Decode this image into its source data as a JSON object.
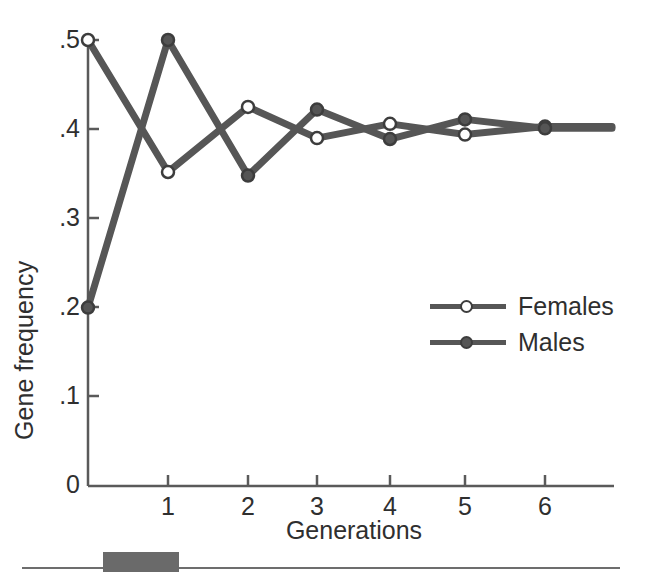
{
  "chart_data": {
    "type": "line",
    "title": "",
    "xlabel": "Generations",
    "ylabel": "Gene frequency",
    "x": [
      0,
      1,
      2,
      3,
      4,
      5,
      6
    ],
    "xtick_labels": [
      "1",
      "2",
      "3",
      "4",
      "5",
      "6"
    ],
    "xtick_values": [
      1,
      2,
      3,
      4,
      5,
      6
    ],
    "ytick_labels": [
      "0",
      ".1",
      ".2",
      ".3",
      ".4",
      ".5"
    ],
    "ytick_values": [
      0,
      0.1,
      0.2,
      0.3,
      0.4,
      0.5
    ],
    "xlim": [
      0,
      6.8
    ],
    "ylim": [
      0,
      0.5
    ],
    "grid": false,
    "legend_position": "center-right",
    "series": [
      {
        "name": "Females",
        "marker": "open-circle",
        "color": "#565656",
        "values": [
          0.5,
          0.352,
          0.425,
          0.39,
          0.406,
          0.394,
          0.403
        ]
      },
      {
        "name": "Males",
        "marker": "filled-circle",
        "color": "#565656",
        "values": [
          0.2,
          0.5,
          0.348,
          0.422,
          0.389,
          0.411,
          0.401
        ]
      }
    ]
  },
  "axes": {
    "y_title": "Gene frequency",
    "x_title": "Generations"
  },
  "legend": {
    "items": [
      {
        "label": "Females",
        "marker": "open-circle"
      },
      {
        "label": "Males",
        "marker": "filled-circle"
      }
    ]
  },
  "colors": {
    "line": "#565656",
    "marker_edge": "#3d3d3d",
    "marker_fill_open": "#ffffff",
    "marker_fill_closed": "#555555",
    "axis": "#5a5a5a",
    "text": "#2f2f2f",
    "rule": "#6d6d6d",
    "block": "#6a6a6a"
  }
}
